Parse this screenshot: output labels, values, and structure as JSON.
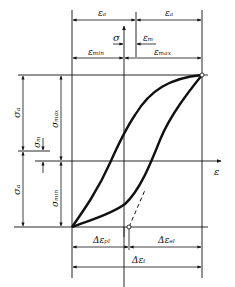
{
  "diagram": {
    "title": "",
    "type": "stress-strain hysteresis loop",
    "axes": {
      "x_label": "ε",
      "y_label": "σ"
    },
    "strain_labels": {
      "eps_a_left": "εₐ",
      "eps_a_right": "εₐ",
      "eps_m": "εₘ",
      "eps_min": "εₘᵢₙ",
      "eps_max": "εₘₐₓ"
    },
    "stress_labels": {
      "sigma_a_upper": "σₐ",
      "sigma_a_lower": "σₐ",
      "sigma_m": "σₘ",
      "sigma_max": "σₘₐₓ",
      "sigma_min": "σₘᵢₙ"
    },
    "bottom_labels": {
      "delta_eps_pl": "Δεₚₗ",
      "delta_eps_el": "Δεₑₗ",
      "delta_eps_t": "Δεₜ"
    },
    "colors": {
      "line": "#111111",
      "background": "#ffffff"
    }
  }
}
